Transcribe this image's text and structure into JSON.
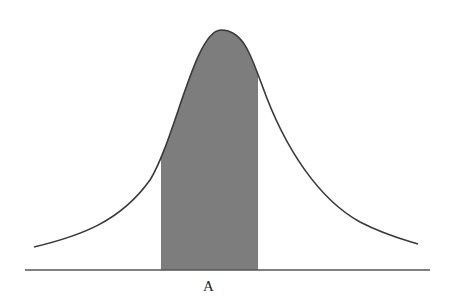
{
  "diagram": {
    "type": "bell-curve-shaded-region",
    "region_label": "A",
    "colors": {
      "curve": "#3a3a3a",
      "fill": "#7d7d7d",
      "baseline": "#555555",
      "background": "#ffffff"
    }
  }
}
